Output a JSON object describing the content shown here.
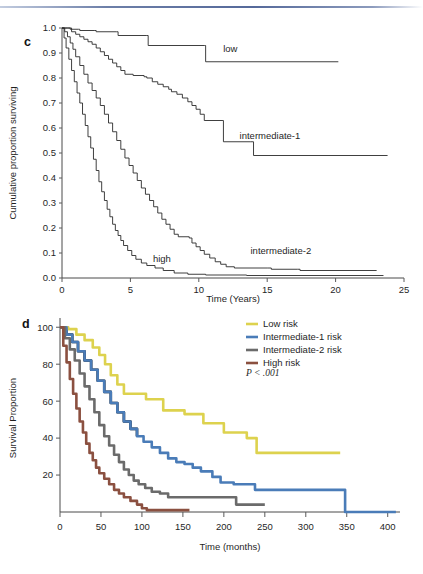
{
  "document": {
    "top_rule_color": "#6d7fa8"
  },
  "panel_c": {
    "letter": "c",
    "xlabel": "Time (Years)",
    "ylabel": "Cumulative proportion surviving",
    "xticks": [
      "0",
      "5",
      "10",
      "15",
      "20",
      "25"
    ],
    "yticks": [
      "0.0",
      "0.1",
      "0.2",
      "0.3",
      "0.4",
      "0.5",
      "0.6",
      "0.7",
      "0.8",
      "0.9",
      "1.0"
    ],
    "curve_labels": {
      "low": "low",
      "intermediate1": "intermediate-1",
      "intermediate2": "intermediate-2",
      "high": "high"
    }
  },
  "panel_d": {
    "letter": "d",
    "xlabel": "Time (months)",
    "ylabel": "Survival Proportion",
    "xticks": [
      "0",
      "50",
      "100",
      "150",
      "200",
      "250",
      "300",
      "350",
      "400"
    ],
    "yticks": [
      "20",
      "40",
      "60",
      "80",
      "100"
    ],
    "pvalue": "P < .001",
    "legend": [
      {
        "label": "Low risk",
        "color": "#ddd24e"
      },
      {
        "label": "Intermediate-1 risk",
        "color": "#4a7cb8"
      },
      {
        "label": "Intermediate-2 risk",
        "color": "#6b6b6b"
      },
      {
        "label": "High risk",
        "color": "#8b5040"
      }
    ]
  },
  "chart_data": [
    {
      "type": "line",
      "subtype": "kaplan-meier-step",
      "panel": "c",
      "title": "",
      "xlabel": "Time (Years)",
      "ylabel": "Cumulative proportion surviving",
      "xlim": [
        0,
        25
      ],
      "ylim": [
        0.0,
        1.0
      ],
      "xticks": [
        0,
        5,
        10,
        15,
        20,
        25
      ],
      "yticks": [
        0.0,
        0.1,
        0.2,
        0.3,
        0.4,
        0.5,
        0.6,
        0.7,
        0.8,
        0.9,
        1.0
      ],
      "grid": false,
      "legend_position": "inline-annotations",
      "series": [
        {
          "name": "low",
          "color": "#3a3a3a",
          "points": [
            [
              0.0,
              1.0
            ],
            [
              0.4,
              1.0
            ],
            [
              0.6,
              0.995
            ],
            [
              1.2,
              0.995
            ],
            [
              1.3,
              0.99
            ],
            [
              2.4,
              0.99
            ],
            [
              2.5,
              0.985
            ],
            [
              4.0,
              0.985
            ],
            [
              4.1,
              0.97
            ],
            [
              6.2,
              0.97
            ],
            [
              6.3,
              0.93
            ],
            [
              10.4,
              0.93
            ],
            [
              10.5,
              0.865
            ],
            [
              20.2,
              0.865
            ]
          ]
        },
        {
          "name": "intermediate-1",
          "color": "#3a3a3a",
          "points": [
            [
              0.0,
              1.0
            ],
            [
              0.5,
              1.0
            ],
            [
              0.7,
              0.985
            ],
            [
              1.0,
              0.975
            ],
            [
              1.3,
              0.965
            ],
            [
              1.6,
              0.955
            ],
            [
              1.9,
              0.945
            ],
            [
              2.2,
              0.935
            ],
            [
              2.5,
              0.92
            ],
            [
              2.8,
              0.905
            ],
            [
              3.1,
              0.89
            ],
            [
              3.4,
              0.875
            ],
            [
              3.7,
              0.86
            ],
            [
              4.0,
              0.845
            ],
            [
              4.3,
              0.83
            ],
            [
              4.6,
              0.815
            ],
            [
              5.2,
              0.81
            ],
            [
              6.0,
              0.805
            ],
            [
              6.2,
              0.8
            ],
            [
              6.6,
              0.785
            ],
            [
              7.0,
              0.775
            ],
            [
              7.4,
              0.765
            ],
            [
              7.8,
              0.755
            ],
            [
              8.0,
              0.745
            ],
            [
              8.4,
              0.735
            ],
            [
              8.8,
              0.72
            ],
            [
              9.2,
              0.705
            ],
            [
              9.5,
              0.69
            ],
            [
              9.8,
              0.675
            ],
            [
              10.1,
              0.655
            ],
            [
              10.4,
              0.63
            ],
            [
              11.7,
              0.63
            ],
            [
              11.8,
              0.545
            ],
            [
              13.8,
              0.545
            ],
            [
              14.0,
              0.49
            ],
            [
              23.8,
              0.49
            ]
          ]
        },
        {
          "name": "intermediate-2",
          "color": "#3a3a3a",
          "points": [
            [
              0.0,
              1.0
            ],
            [
              0.2,
              0.985
            ],
            [
              0.4,
              0.965
            ],
            [
              0.6,
              0.94
            ],
            [
              0.8,
              0.915
            ],
            [
              1.0,
              0.885
            ],
            [
              1.3,
              0.85
            ],
            [
              1.6,
              0.815
            ],
            [
              1.9,
              0.78
            ],
            [
              2.2,
              0.75
            ],
            [
              2.5,
              0.72
            ],
            [
              2.8,
              0.69
            ],
            [
              3.1,
              0.655
            ],
            [
              3.4,
              0.62
            ],
            [
              3.7,
              0.585
            ],
            [
              4.0,
              0.55
            ],
            [
              4.3,
              0.515
            ],
            [
              4.6,
              0.48
            ],
            [
              4.9,
              0.45
            ],
            [
              5.2,
              0.42
            ],
            [
              5.5,
              0.39
            ],
            [
              5.8,
              0.36
            ],
            [
              6.1,
              0.335
            ],
            [
              6.4,
              0.31
            ],
            [
              6.7,
              0.285
            ],
            [
              7.0,
              0.26
            ],
            [
              7.3,
              0.235
            ],
            [
              7.6,
              0.215
            ],
            [
              7.9,
              0.195
            ],
            [
              8.2,
              0.175
            ],
            [
              8.5,
              0.165
            ],
            [
              9.3,
              0.16
            ],
            [
              9.5,
              0.14
            ],
            [
              9.8,
              0.125
            ],
            [
              10.1,
              0.11
            ],
            [
              10.4,
              0.095
            ],
            [
              10.8,
              0.08
            ],
            [
              11.2,
              0.065
            ],
            [
              11.6,
              0.055
            ],
            [
              12.0,
              0.045
            ],
            [
              12.6,
              0.04
            ],
            [
              15.0,
              0.04
            ],
            [
              15.3,
              0.035
            ],
            [
              17.2,
              0.035
            ],
            [
              17.4,
              0.03
            ],
            [
              23.0,
              0.03
            ]
          ]
        },
        {
          "name": "high",
          "color": "#3a3a3a",
          "points": [
            [
              0.0,
              1.0
            ],
            [
              0.15,
              0.96
            ],
            [
              0.3,
              0.92
            ],
            [
              0.5,
              0.875
            ],
            [
              0.7,
              0.83
            ],
            [
              0.9,
              0.785
            ],
            [
              1.1,
              0.74
            ],
            [
              1.3,
              0.7
            ],
            [
              1.5,
              0.655
            ],
            [
              1.7,
              0.61
            ],
            [
              1.9,
              0.565
            ],
            [
              2.1,
              0.52
            ],
            [
              2.3,
              0.475
            ],
            [
              2.5,
              0.43
            ],
            [
              2.7,
              0.385
            ],
            [
              2.9,
              0.345
            ],
            [
              3.1,
              0.31
            ],
            [
              3.3,
              0.275
            ],
            [
              3.5,
              0.245
            ],
            [
              3.7,
              0.215
            ],
            [
              3.9,
              0.19
            ],
            [
              4.1,
              0.17
            ],
            [
              4.3,
              0.15
            ],
            [
              4.5,
              0.13
            ],
            [
              4.8,
              0.11
            ],
            [
              5.1,
              0.09
            ],
            [
              5.4,
              0.075
            ],
            [
              5.8,
              0.06
            ],
            [
              6.2,
              0.05
            ],
            [
              6.8,
              0.04
            ],
            [
              7.4,
              0.03
            ],
            [
              8.2,
              0.02
            ],
            [
              9.2,
              0.015
            ],
            [
              10.5,
              0.012
            ],
            [
              13.5,
              0.01
            ],
            [
              23.5,
              0.01
            ]
          ]
        }
      ],
      "annotations": [
        {
          "text": "low",
          "x": 12.3,
          "y": 0.905
        },
        {
          "text": "intermediate-1",
          "x": 15.2,
          "y": 0.555
        },
        {
          "text": "intermediate-2",
          "x": 16.0,
          "y": 0.095
        },
        {
          "text": "high",
          "x": 7.3,
          "y": 0.065
        }
      ]
    },
    {
      "type": "line",
      "subtype": "kaplan-meier-step",
      "panel": "d",
      "title": "",
      "xlabel": "Time (months)",
      "ylabel": "Survival Proportion",
      "xlim": [
        0,
        415
      ],
      "ylim": [
        0,
        105
      ],
      "xticks": [
        0,
        50,
        100,
        150,
        200,
        250,
        300,
        350,
        400
      ],
      "yticks": [
        20,
        40,
        60,
        80,
        100
      ],
      "grid": false,
      "legend_position": "top-right",
      "pvalue": "P < .001",
      "series": [
        {
          "name": "Low risk",
          "color": "#ddd24e",
          "points": [
            [
              0,
              100
            ],
            [
              10,
              99
            ],
            [
              20,
              96
            ],
            [
              30,
              93
            ],
            [
              40,
              89
            ],
            [
              48,
              85
            ],
            [
              55,
              80
            ],
            [
              62,
              74
            ],
            [
              70,
              69
            ],
            [
              78,
              64
            ],
            [
              100,
              64
            ],
            [
              105,
              61
            ],
            [
              122,
              61
            ],
            [
              126,
              55
            ],
            [
              150,
              55
            ],
            [
              152,
              53
            ],
            [
              170,
              53
            ],
            [
              175,
              48
            ],
            [
              196,
              48
            ],
            [
              200,
              43
            ],
            [
              222,
              43
            ],
            [
              228,
              40
            ],
            [
              238,
              40
            ],
            [
              240,
              32
            ],
            [
              342,
              32
            ]
          ]
        },
        {
          "name": "Intermediate-1 risk",
          "color": "#4a7cb8",
          "points": [
            [
              0,
              100
            ],
            [
              8,
              96
            ],
            [
              15,
              92
            ],
            [
              22,
              87
            ],
            [
              30,
              82
            ],
            [
              38,
              77
            ],
            [
              46,
              71
            ],
            [
              54,
              65
            ],
            [
              62,
              59
            ],
            [
              70,
              54
            ],
            [
              78,
              49
            ],
            [
              86,
              45
            ],
            [
              94,
              41
            ],
            [
              102,
              38
            ],
            [
              112,
              35
            ],
            [
              122,
              32
            ],
            [
              132,
              29
            ],
            [
              142,
              27
            ],
            [
              152,
              26
            ],
            [
              162,
              24
            ],
            [
              172,
              22
            ],
            [
              178,
              22
            ],
            [
              186,
              19
            ],
            [
              196,
              16
            ],
            [
              204,
              16
            ],
            [
              212,
              15
            ],
            [
              232,
              15
            ],
            [
              238,
              12
            ],
            [
              347,
              12
            ],
            [
              348,
              0
            ],
            [
              410,
              0
            ]
          ]
        },
        {
          "name": "Intermediate-2 risk",
          "color": "#6b6b6b",
          "points": [
            [
              0,
              100
            ],
            [
              6,
              94
            ],
            [
              12,
              88
            ],
            [
              18,
              82
            ],
            [
              24,
              75
            ],
            [
              30,
              68
            ],
            [
              36,
              61
            ],
            [
              42,
              54
            ],
            [
              48,
              47
            ],
            [
              54,
              41
            ],
            [
              60,
              36
            ],
            [
              66,
              31
            ],
            [
              72,
              27
            ],
            [
              78,
              23
            ],
            [
              84,
              20
            ],
            [
              90,
              17
            ],
            [
              96,
              15
            ],
            [
              104,
              13
            ],
            [
              112,
              11
            ],
            [
              122,
              10
            ],
            [
              132,
              8
            ],
            [
              160,
              8
            ],
            [
              178,
              8
            ],
            [
              196,
              8
            ],
            [
              212,
              8
            ],
            [
              215,
              4
            ],
            [
              250,
              4
            ]
          ]
        },
        {
          "name": "High risk",
          "color": "#8b5040",
          "points": [
            [
              0,
              100
            ],
            [
              4,
              90
            ],
            [
              8,
              81
            ],
            [
              12,
              72
            ],
            [
              16,
              64
            ],
            [
              20,
              56
            ],
            [
              24,
              49
            ],
            [
              28,
              43
            ],
            [
              32,
              37
            ],
            [
              36,
              32
            ],
            [
              40,
              28
            ],
            [
              44,
              24
            ],
            [
              48,
              21
            ],
            [
              54,
              18
            ],
            [
              60,
              15
            ],
            [
              66,
              12
            ],
            [
              72,
              10
            ],
            [
              78,
              8
            ],
            [
              86,
              6
            ],
            [
              94,
              4
            ],
            [
              100,
              2
            ],
            [
              106,
              1
            ],
            [
              120,
              1
            ],
            [
              158,
              1
            ]
          ]
        }
      ]
    }
  ]
}
